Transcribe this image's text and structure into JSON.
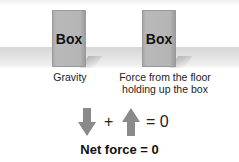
{
  "diagram": {
    "boxes": [
      {
        "label": "Box",
        "caption": "Gravity"
      },
      {
        "label": "Box",
        "caption_lines": [
          "Force from the floor",
          "holding up the box"
        ]
      }
    ],
    "equation": {
      "down_arrow": "gravity-arrow-down",
      "plus": "+",
      "up_arrow": "normal-force-arrow-up",
      "equals": "= 0"
    },
    "conclusion": "Net force = 0",
    "colors": {
      "box": "#b5b5b5",
      "arrow": "#8a8a8a",
      "floor": "#d6d6d6"
    }
  }
}
